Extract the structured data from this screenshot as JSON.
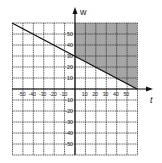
{
  "chart_data": {
    "type": "area",
    "title": "",
    "xlabel": "t",
    "ylabel": "w",
    "xlim": [
      -60,
      60
    ],
    "ylim": [
      -60,
      60
    ],
    "grid": true,
    "grid_step": 10,
    "x_ticks": [
      -50,
      -40,
      -30,
      -20,
      -10,
      10,
      20,
      30,
      40,
      50
    ],
    "y_ticks": [
      50,
      40,
      30,
      20,
      10,
      -10,
      -20,
      -30,
      -40,
      -50
    ],
    "boundary_line": {
      "equation": "w = 30 - t/2",
      "points": [
        [
          -60,
          60
        ],
        [
          60,
          0
        ]
      ]
    },
    "shaded_region": {
      "description": "t >= 0 and w >= 30 - t/2",
      "vertices": [
        [
          0,
          60
        ],
        [
          60,
          60
        ],
        [
          60,
          0
        ],
        [
          0,
          30
        ]
      ],
      "color": "#a6a6a6"
    },
    "legend": null
  },
  "labels": {
    "x_axis": "t",
    "y_axis": "w",
    "x_ticks": [
      "-50",
      "-40",
      "-30",
      "-20",
      "-10",
      "10",
      "20",
      "30",
      "40",
      "50"
    ],
    "y_ticks": [
      "50",
      "40",
      "30",
      "20",
      "10",
      "-10",
      "-20",
      "-30",
      "-40",
      "-50"
    ]
  }
}
